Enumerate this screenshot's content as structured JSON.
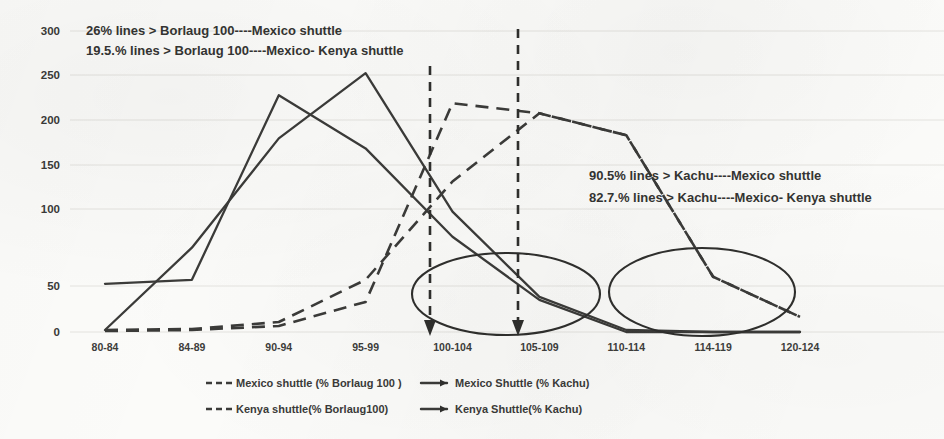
{
  "chart_data": {
    "type": "line",
    "title": "",
    "xlabel": "",
    "ylabel": "",
    "ylim": [
      0,
      300
    ],
    "ytick_values": [
      0,
      50,
      100,
      150,
      200,
      250,
      300
    ],
    "ytick_labels": [
      "0",
      "50",
      "100",
      "150",
      "200",
      "250",
      "300"
    ],
    "grid": true,
    "legend_position": "bottom",
    "categories": [
      "80-84",
      "84-89",
      "90-94",
      "95-99",
      "100-104",
      "105-109",
      "110-114",
      "114-119",
      "120-124"
    ],
    "series": [
      {
        "name": "Mexico shuttle (% Borlaug 100 )",
        "style": "dashed",
        "color": "#3b3b39",
        "values": [
          1,
          2,
          6,
          30,
          228,
          218,
          196,
          55,
          15
        ]
      },
      {
        "name": "Mexico Shuttle (% Kachu)",
        "style": "solid",
        "color": "#3b3b39",
        "values": [
          48,
          52,
          236,
          183,
          95,
          32,
          0,
          0,
          0
        ]
      },
      {
        "name": "Kenya shuttle(% Borlaug100)",
        "style": "dashed",
        "color": "#3b3b39",
        "values": [
          2,
          3,
          10,
          52,
          150,
          218,
          196,
          55,
          15
        ]
      },
      {
        "name": "Kenya Shuttle(% Kachu)",
        "style": "solid",
        "color": "#3b3b39",
        "values": [
          2,
          84,
          193,
          258,
          120,
          35,
          2,
          0,
          0
        ]
      }
    ],
    "annotations": [
      {
        "id": "top-1",
        "text": "26% lines > Borlaug 100----Mexico shuttle"
      },
      {
        "id": "top-2",
        "text": "19.5.% lines > Borlaug 100----Mexico- Kenya shuttle"
      },
      {
        "id": "right-1",
        "text": "90.5% lines > Kachu----Mexico shuttle"
      },
      {
        "id": "right-2",
        "text": "82.7.% lines > Kachu----Mexico- Kenya shuttle"
      }
    ],
    "callout_markers": [
      {
        "id": "ellipse-left",
        "shape": "ellipse",
        "around_categories": [
          "100-104",
          "105-109"
        ]
      },
      {
        "id": "ellipse-right",
        "shape": "ellipse",
        "around_categories": [
          "114-119",
          "120-124"
        ]
      },
      {
        "id": "arrow-100-104",
        "shape": "vertical-dashed-arrow",
        "at_category": "100-104"
      },
      {
        "id": "arrow-105-109",
        "shape": "vertical-dashed-arrow",
        "at_category": "105-109"
      }
    ]
  },
  "legend": {
    "entries": [
      {
        "label": "Mexico shuttle (% Borlaug 100 )",
        "style": "dashed"
      },
      {
        "label": "Mexico Shuttle (% Kachu)",
        "style": "solid"
      },
      {
        "label": "Kenya shuttle(% Borlaug100)",
        "style": "dashed"
      },
      {
        "label": "Kenya Shuttle(% Kachu)",
        "style": "solid"
      }
    ]
  }
}
